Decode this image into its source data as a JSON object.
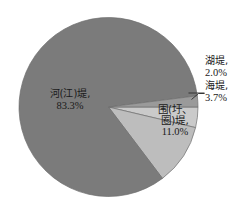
{
  "chart_data": {
    "type": "pie",
    "title": "",
    "subtitle": "",
    "xlabel": "",
    "ylabel": "",
    "legend_position": "none",
    "grid": false,
    "unit": "%",
    "categories": [
      "河(江)堤",
      "围(圩、圈)堤",
      "海堤",
      "湖堤"
    ],
    "values": [
      83.3,
      11.0,
      3.7,
      2.0
    ],
    "slices": [
      {
        "name": "河(江)堤",
        "value": 83.3,
        "value_label": "83.3%",
        "color": "#7b7b7b",
        "label_placement": "inside",
        "label_lines": [
          "河(江)堤,",
          "83.3%"
        ]
      },
      {
        "name": "围(圩、圈)堤",
        "value": 11.0,
        "value_label": "11.0%",
        "color": "#bdbdbd",
        "label_placement": "inside",
        "label_lines": [
          "围(圩、",
          "圈)堤,",
          "11.0%"
        ]
      },
      {
        "name": "海堤",
        "value": 3.7,
        "value_label": "3.7%",
        "color": "#cacaca",
        "label_placement": "outside",
        "label_lines": [
          "海堤,",
          "3.7%"
        ]
      },
      {
        "name": "湖堤",
        "value": 2.0,
        "value_label": "2.0%",
        "color": "#9a9a9a",
        "label_placement": "outside",
        "label_lines": [
          "湖堤,",
          "2.0%"
        ]
      }
    ],
    "colors": {
      "river_slice": "#7b7b7b",
      "enclosure_slice": "#bdbdbd",
      "sea_slice": "#cacaca",
      "lake_slice": "#9a9a9a",
      "outline": "#5a5a5a",
      "leader_line": "#2a2a2a",
      "background": "#ffffff",
      "text": "#1a1a1a"
    }
  },
  "labels": {
    "river": {
      "name": "河(江)堤,",
      "percent": "83.3%"
    },
    "enclosure": {
      "name_line1": "围(圩、",
      "name_line2": "圈)堤,",
      "percent": "11.0%"
    },
    "lake": {
      "name": "湖堤,",
      "percent": "2.0%"
    },
    "sea": {
      "name": "海堤,",
      "percent": "3.7%"
    }
  }
}
